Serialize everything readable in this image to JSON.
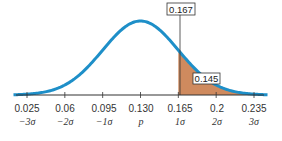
{
  "chart_data": {
    "type": "area",
    "title": "",
    "mean_label": "p",
    "mean": 0.13,
    "sd": 0.035,
    "categories": [
      "0.025",
      "0.06",
      "0.095",
      "0.130",
      "0.165",
      "0.2",
      "0.235"
    ],
    "sigma_labels": [
      "−3σ",
      "−2σ",
      "−1σ",
      "p",
      "1σ",
      "2σ",
      "3σ"
    ],
    "x": [
      0.025,
      0.06,
      0.095,
      0.13,
      0.165,
      0.2,
      0.235
    ],
    "xlabel": "",
    "ylabel": "",
    "annotations": [
      {
        "label": "0.167",
        "position": "top marker line at x ≈ 0.167"
      },
      {
        "label": "0.145",
        "position": "inside shaded tail region"
      }
    ],
    "shaded_region": {
      "from": 0.165,
      "to": 0.235
    },
    "grid": false,
    "colors": {
      "curve": "#1e8fc8",
      "shade": "#cf8a5e",
      "axis": "#333333"
    }
  },
  "labels": {
    "box_top": "0.167",
    "box_tail": "0.145",
    "ticks": [
      "0.025",
      "0.06",
      "0.095",
      "0.130",
      "0.165",
      "0.2",
      "0.235"
    ],
    "sigmas": [
      "−3σ",
      "−2σ",
      "−1σ",
      "p",
      "1σ",
      "2σ",
      "3σ"
    ]
  }
}
